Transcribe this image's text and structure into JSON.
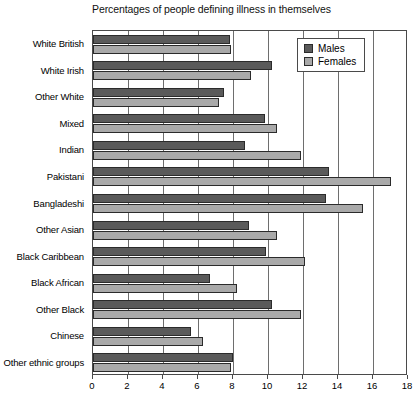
{
  "chart_data": {
    "type": "bar",
    "orientation": "horizontal",
    "title": "Percentages of people defining illness in themselves",
    "xlabel": "",
    "ylabel": "",
    "xlim": [
      0,
      18
    ],
    "xticks": [
      0,
      2,
      4,
      6,
      8,
      10,
      12,
      14,
      16,
      18
    ],
    "grid": true,
    "legend_position": "top-right",
    "categories": [
      "White British",
      "White Irish",
      "Other White",
      "Mixed",
      "Indian",
      "Pakistani",
      "Bangladeshi",
      "Other Asian",
      "Black Caribbean",
      "Black African",
      "Other Black",
      "Chinese",
      "Other ethnic groups"
    ],
    "series": [
      {
        "name": "Males",
        "color": "#5a5a5a",
        "values": [
          7.8,
          10.2,
          7.5,
          9.8,
          8.7,
          13.5,
          13.3,
          8.9,
          9.9,
          6.7,
          10.2,
          5.6,
          8.0
        ]
      },
      {
        "name": "Females",
        "color": "#a9a9a9",
        "values": [
          7.9,
          9.0,
          7.2,
          10.5,
          11.9,
          17.0,
          15.4,
          10.5,
          12.1,
          8.2,
          11.9,
          6.3,
          7.9
        ]
      }
    ]
  },
  "legend": {
    "items": [
      {
        "label": "Males",
        "swatch": "males"
      },
      {
        "label": "Females",
        "swatch": "females"
      }
    ]
  }
}
